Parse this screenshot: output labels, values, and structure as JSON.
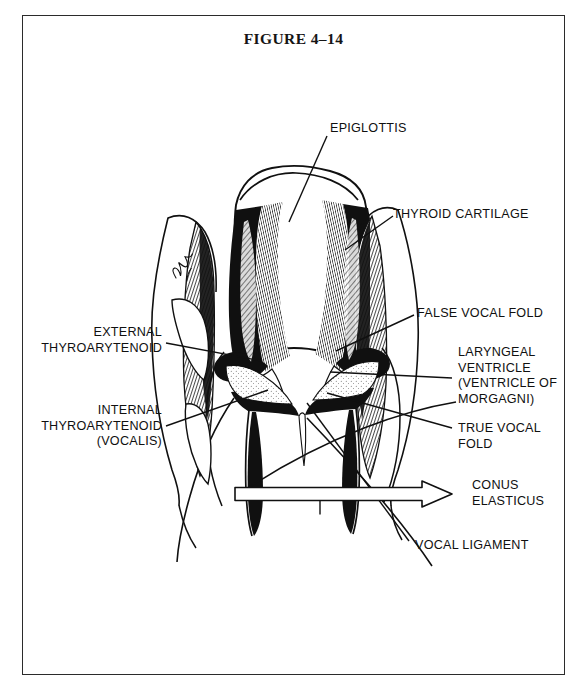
{
  "figure": {
    "title": "FIGURE 4–14",
    "artist_signature": "Paske"
  },
  "colors": {
    "ink": "#101010",
    "frame": "#2b2b2b",
    "paper": "#ffffff"
  },
  "labels": [
    {
      "id": "epiglottis",
      "lines": [
        "EPIGLOTTIS"
      ],
      "align": "left",
      "x": 330,
      "y": 121
    },
    {
      "id": "thyroid-cartilage",
      "lines": [
        "THYROID CARTILAGE"
      ],
      "align": "left",
      "x": 393,
      "y": 207
    },
    {
      "id": "false-vocal-fold",
      "lines": [
        "FALSE VOCAL FOLD"
      ],
      "align": "left",
      "x": 417,
      "y": 306
    },
    {
      "id": "laryngeal-ventricle",
      "lines": [
        "LARYNGEAL",
        "VENTRICLE",
        "(VENTRICLE OF",
        "MORGAGNI)"
      ],
      "align": "left",
      "x": 458,
      "y": 345
    },
    {
      "id": "true-vocal-fold",
      "lines": [
        "TRUE VOCAL",
        "FOLD"
      ],
      "align": "left",
      "x": 458,
      "y": 421
    },
    {
      "id": "conus-elasticus",
      "lines": [
        "CONUS",
        "ELASTICUS"
      ],
      "align": "left",
      "x": 472,
      "y": 478
    },
    {
      "id": "vocal-ligament",
      "lines": [
        "VOCAL LIGAMENT"
      ],
      "align": "left",
      "x": 415,
      "y": 538
    },
    {
      "id": "external-thyroarytenoid",
      "lines": [
        "EXTERNAL",
        "THYROARYTENOID"
      ],
      "align": "right",
      "x": 30,
      "y": 325,
      "width": 132
    },
    {
      "id": "internal-thyroarytenoid",
      "lines": [
        "INTERNAL",
        "THYROARYTENOID",
        "(VOCALIS)"
      ],
      "align": "right",
      "x": 30,
      "y": 403,
      "width": 132
    }
  ],
  "leader_lines": [
    {
      "id": "leader-epiglottis",
      "from": [
        327,
        136
      ],
      "to": [
        289,
        222
      ]
    },
    {
      "id": "leader-thyroid-cartilage",
      "from": [
        393,
        216
      ],
      "to": [
        345,
        250
      ]
    },
    {
      "id": "leader-false-vocal-fold",
      "from": [
        414,
        315
      ],
      "to": [
        336,
        351
      ]
    },
    {
      "id": "leader-laryngeal-ventricle",
      "from": [
        452,
        378
      ],
      "to": [
        330,
        372
      ]
    },
    {
      "id": "leader-true-vocal-fold",
      "from": [
        452,
        428
      ],
      "to": [
        327,
        393
      ]
    },
    {
      "id": "leader-vocal-ligament",
      "from": [
        409,
        541
      ],
      "to": [
        307,
        403
      ]
    },
    {
      "id": "leader-external-thyroarytenoid",
      "from": [
        166,
        343
      ],
      "to": [
        262,
        361
      ]
    },
    {
      "id": "leader-internal-thyroarytenoid",
      "from": [
        166,
        426
      ],
      "to": [
        268,
        390
      ]
    }
  ],
  "conus_arrow": {
    "id": "conus-elasticus-arrow",
    "shaft_from": [
      235,
      494
    ],
    "shaft_to": [
      452,
      494
    ],
    "tick_x": 320,
    "style": "hollow-outline"
  }
}
